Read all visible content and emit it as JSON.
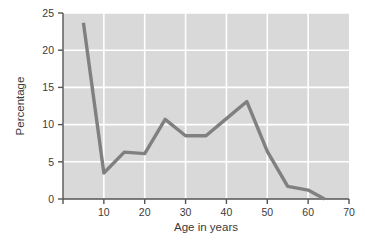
{
  "chart_data": {
    "type": "line",
    "title": "",
    "xlabel": "Age in years",
    "ylabel": "Percentage",
    "xlim": [
      0,
      70
    ],
    "ylim": [
      0,
      25
    ],
    "xticks": [
      0,
      10,
      20,
      30,
      40,
      50,
      60,
      70
    ],
    "xtick_labels": [
      "",
      "10",
      "20",
      "30",
      "40",
      "50",
      "60",
      "70"
    ],
    "yticks": [
      0,
      5,
      10,
      15,
      20,
      25
    ],
    "ytick_labels": [
      "0",
      "5",
      "10",
      "15",
      "20",
      "25"
    ],
    "grid": true,
    "legend": "none",
    "series": [
      {
        "name": "Percentage",
        "x": [
          5,
          10,
          15,
          20,
          25,
          30,
          35,
          40,
          45,
          50,
          55,
          60,
          64
        ],
        "values": [
          23.7,
          3.5,
          6.3,
          6.1,
          10.7,
          8.5,
          8.5,
          10.8,
          13.1,
          6.4,
          1.7,
          1.2,
          0.0
        ]
      }
    ],
    "style": {
      "plot_background": "#d9d9d9",
      "grid_color": "#ffffff",
      "line_color": "#808080",
      "axis_color": "#555555",
      "text_color": "#3a3a3a",
      "line_width": 3.4
    }
  }
}
